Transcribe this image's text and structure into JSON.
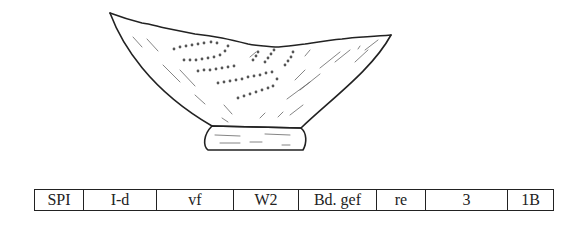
{
  "figure": {
    "stroke_color": "#222222",
    "background_color": "#ffffff"
  },
  "code_table": {
    "cells": [
      "SPI",
      "I-d",
      "vf",
      "W2",
      "Bd. gef",
      "re",
      "3",
      "1B"
    ],
    "widths": [
      48,
      72,
      76,
      64,
      77,
      48,
      81,
      45
    ]
  }
}
